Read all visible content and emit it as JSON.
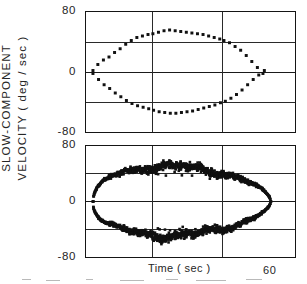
{
  "figure": {
    "axis_label_y_line1": "SLOW-COMPONENT",
    "axis_label_y_line2": "VELOCITY ( deg / sec )",
    "axis_label_x": "Time ( sec )",
    "x_end_label": "60",
    "marker_color": "#111111",
    "axis_color": "#151515",
    "grid_color": "#2a2a2a"
  },
  "panels": [
    {
      "id": "panel-top",
      "name": "upper-panel",
      "y_ticks": [
        "80",
        "0",
        "-80"
      ],
      "x_ticks": []
    },
    {
      "id": "panel-bottom",
      "name": "lower-panel",
      "y_ticks": [
        "80",
        "0",
        "-80"
      ],
      "x_ticks": [
        "60"
      ]
    }
  ],
  "chart_data": [
    {
      "type": "scatter",
      "panel": "upper",
      "title": "",
      "xlabel": "Time ( sec )",
      "ylabel": "SLOW-COMPONENT VELOCITY ( deg / sec )",
      "xlim": [
        0,
        60
      ],
      "ylim": [
        -80,
        80
      ],
      "yticks": [
        -80,
        0,
        80
      ],
      "ygrid": [
        -40,
        0,
        40
      ],
      "xgrid": [
        19,
        39
      ],
      "grid": true,
      "legend": "none",
      "marker": "filled-square",
      "marker_size_px": 3,
      "series": [
        {
          "name": "upper-branch",
          "x": [
            2.0,
            3.4,
            5.0,
            6.6,
            8.2,
            9.8,
            11.4,
            13.0,
            14.6,
            16.2,
            17.8,
            19.2,
            20.8,
            22.4,
            24.0,
            25.6,
            27.2,
            28.8,
            30.4,
            32.0,
            33.6,
            35.2,
            36.8,
            38.4,
            39.6,
            41.2,
            42.8,
            44.4,
            46.0,
            47.6,
            49.2,
            50.8
          ],
          "y": [
            2.0,
            10.0,
            16.0,
            20.0,
            26.0,
            31.0,
            37.0,
            42.0,
            46.0,
            48.0,
            50.0,
            51.0,
            53.0,
            55.0,
            56.0,
            55.0,
            54.0,
            53.0,
            52.0,
            51.0,
            50.0,
            48.0,
            46.0,
            44.0,
            42.0,
            39.0,
            34.0,
            29.0,
            22.0,
            14.0,
            6.0,
            -2.0
          ]
        },
        {
          "name": "lower-branch",
          "x": [
            2.0,
            3.6,
            5.2,
            6.8,
            8.4,
            10.0,
            11.6,
            13.2,
            14.8,
            16.4,
            18.0,
            19.4,
            21.0,
            22.6,
            24.2,
            25.8,
            27.4,
            29.0,
            30.6,
            32.2,
            33.8,
            35.4,
            37.0,
            38.6,
            40.0,
            41.6,
            43.2,
            44.8,
            46.4,
            48.0,
            49.6,
            51.2
          ],
          "y": [
            -2.0,
            -10.0,
            -17.0,
            -22.0,
            -28.0,
            -33.0,
            -38.0,
            -42.0,
            -45.0,
            -47.0,
            -49.0,
            -51.0,
            -53.0,
            -54.0,
            -55.0,
            -55.0,
            -54.0,
            -53.0,
            -52.0,
            -50.0,
            -48.0,
            -46.0,
            -44.0,
            -41.0,
            -39.0,
            -35.0,
            -30.0,
            -24.0,
            -17.0,
            -10.0,
            -4.0,
            2.0
          ]
        }
      ]
    },
    {
      "type": "scatter",
      "panel": "lower",
      "title": "",
      "xlabel": "Time ( sec )",
      "ylabel": "SLOW-COMPONENT VELOCITY ( deg / sec )",
      "xlim": [
        0,
        60
      ],
      "ylim": [
        -80,
        80
      ],
      "yticks": [
        -80,
        0,
        80
      ],
      "ygrid": [
        -40,
        0,
        40
      ],
      "xgrid": [
        19,
        39
      ],
      "grid": true,
      "legend": "none",
      "marker": "filled-square",
      "marker_size_px": 3,
      "density": "dense",
      "series": [
        {
          "name": "upper-branch-dense",
          "envelope_peak": 50,
          "start_x": 2.0,
          "end_x": 53.0,
          "noise_amplitude": 5
        },
        {
          "name": "lower-branch-dense",
          "envelope_peak": -50,
          "start_x": 2.0,
          "end_x": 53.0,
          "noise_amplitude": 5
        }
      ]
    }
  ]
}
